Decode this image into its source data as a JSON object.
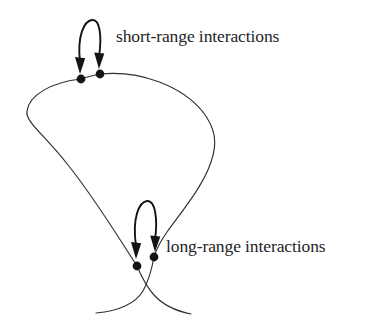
{
  "figure": {
    "background_color": "#ffffff",
    "chain_color": "#2f2f33",
    "arrow_color": "#141418",
    "dot_color": "#141418",
    "text_color": "#242428"
  },
  "labels": {
    "short_range": "short-range interactions",
    "long_range": "long-range interactions"
  },
  "annotations": [
    {
      "id": "short-range",
      "label": "short-range interactions",
      "arrow_type": "double-headed-arc",
      "arrow_direction": "downward",
      "targets": [
        {
          "name": "contact-dot-upper-left",
          "x": 81,
          "y": 79
        },
        {
          "name": "contact-dot-upper-right",
          "x": 100,
          "y": 74
        }
      ]
    },
    {
      "id": "long-range",
      "label": "long-range interactions",
      "arrow_type": "double-headed-arc",
      "arrow_direction": "downward",
      "targets": [
        {
          "name": "contact-dot-lower-left",
          "x": 137,
          "y": 266
        },
        {
          "name": "contact-dot-lower-right",
          "x": 154,
          "y": 257
        }
      ]
    }
  ],
  "chain": {
    "description": "single continuous curve forming a large loop closing at a crossing near the lower contact points, with two free tails flaring outward at the bottom",
    "loop_extremes": {
      "left_x": 27,
      "right_x": 217,
      "top_y": 72,
      "crossing_y": 262
    }
  }
}
